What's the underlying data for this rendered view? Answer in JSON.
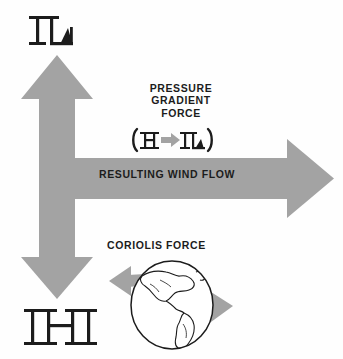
{
  "figure": {
    "background_color": "#fefefe",
    "arrow_color": "#a3a3a3",
    "text_color": "#1c1c1c",
    "outline_color": "#1c1c1c"
  },
  "labels": {
    "pressure_gradient_force_line1": "PRESSURE",
    "pressure_gradient_force_line2": "GRADIENT",
    "pressure_gradient_force_line3": "FORCE",
    "resulting_wind_flow": "RESULTING WIND FLOW",
    "coriolis_force": "CORIOLIS FORCE"
  },
  "pressure_symbols": {
    "low_top": "L",
    "high_bottom": "H",
    "formula_open_paren": "(",
    "formula_high": "H",
    "formula_arrow": "arrow-right",
    "formula_low": "L",
    "formula_close_paren": ")"
  },
  "arrows": {
    "up_arrow": "arrow-up",
    "right_arrow": "arrow-right",
    "down_arrow": "arrow-down",
    "globe_arrow_left": "arrow-left",
    "globe_arrow_right": "arrow-right"
  },
  "globe": {
    "name": "earth-globe",
    "depicts": "Americas"
  }
}
